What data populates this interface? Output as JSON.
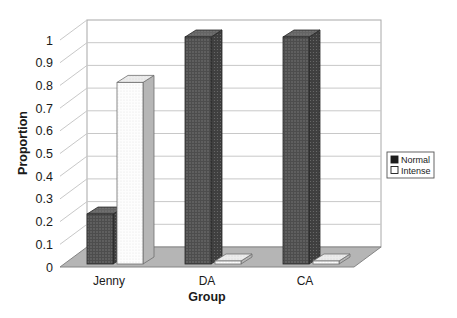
{
  "chart_data": {
    "type": "bar",
    "projection": "3d",
    "title": "",
    "xlabel": "Group",
    "ylabel": "Proportion",
    "categories": [
      "Jenny",
      "DA",
      "CA"
    ],
    "series": [
      {
        "name": "Normal",
        "values": [
          0.22,
          1.0,
          1.0
        ],
        "style": "dark-dotted"
      },
      {
        "name": "Intense",
        "values": [
          0.8,
          0.0,
          0.0
        ],
        "style": "white"
      }
    ],
    "ylim": [
      0,
      1
    ],
    "ytick_step": 0.1,
    "yticks": [
      "0",
      "0.1",
      "0.2",
      "0.3",
      "0.4",
      "0.5",
      "0.6",
      "0.7",
      "0.8",
      "0.9",
      "1"
    ],
    "grid": true,
    "legend_position": "middle-right",
    "legend": [
      "Normal",
      "Intense"
    ],
    "colors": {
      "background": "#ffffff",
      "text": "#1a1a1a",
      "normal_bar": "#4d4d4d",
      "normal_bar_dot": "#7e7e7e",
      "normal_bar_side": "#3f3f3f",
      "normal_bar_top": "#646464",
      "normal_bar_stroke": "#262626",
      "intense_bar": "#fdfdfd",
      "intense_bar_dot": "#e0e0e0",
      "intense_bar_side": "#b6b6b6",
      "intense_bar_top": "#ececec",
      "intense_bar_stroke": "#6f6f6f",
      "floor": "#b5b5b5",
      "floor_border": "#858585",
      "gridline": "#c8c8c8",
      "wall_border": "#a8a8a8",
      "legend_border": "#555555",
      "legend_normal_swatch": "#1c1c1c"
    }
  }
}
